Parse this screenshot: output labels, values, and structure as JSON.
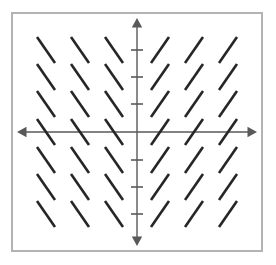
{
  "figure": {
    "kind": "slope-field",
    "title": "",
    "width": 276,
    "height": 265
  },
  "style": {
    "border_color": "#b3b3b3",
    "axis_color": "#595959",
    "segment_color": "#262626",
    "background_color": "#ffffff",
    "segment_width": 2.6,
    "axis_width": 1.4,
    "tick_width": 1.6
  },
  "frame": {
    "x": 11,
    "y": 12,
    "width": 252,
    "height": 240
  },
  "axes": {
    "origin": {
      "x": 137,
      "y": 132
    },
    "x_axis": {
      "label": "",
      "start_x": 17,
      "end_x": 257,
      "arrow_left": true,
      "arrow_right": true,
      "ticks": []
    },
    "y_axis": {
      "label": "",
      "start_y": 18,
      "end_y": 246,
      "arrow_up": true,
      "arrow_down": true,
      "tick_half_length": 6,
      "ticks": [
        50,
        77,
        104,
        160,
        187,
        214
      ]
    }
  },
  "chart_data": {
    "type": "scatter",
    "title": "",
    "xlabel": "",
    "ylabel": "",
    "xlim": [
      -3.5,
      3.5
    ],
    "ylim": [
      -3.5,
      3.5
    ],
    "grid": false,
    "legend": null,
    "columns_x": [
      46,
      80,
      114,
      160,
      194,
      228
    ],
    "rows_y": [
      50,
      77,
      104,
      132,
      160,
      187,
      214
    ],
    "segment_half_dx": 9,
    "segment_half_dy": 13,
    "slopes_by_column": [
      -1.44,
      -1.44,
      -1.44,
      1.44,
      1.44,
      1.44
    ],
    "segments": [
      {
        "cx": 46,
        "cy": 50,
        "slope": -1.44
      },
      {
        "cx": 80,
        "cy": 50,
        "slope": -1.44
      },
      {
        "cx": 114,
        "cy": 50,
        "slope": -1.44
      },
      {
        "cx": 160,
        "cy": 50,
        "slope": 1.44
      },
      {
        "cx": 194,
        "cy": 50,
        "slope": 1.44
      },
      {
        "cx": 228,
        "cy": 50,
        "slope": 1.44
      },
      {
        "cx": 46,
        "cy": 77,
        "slope": -1.44
      },
      {
        "cx": 80,
        "cy": 77,
        "slope": -1.44
      },
      {
        "cx": 114,
        "cy": 77,
        "slope": -1.44
      },
      {
        "cx": 160,
        "cy": 77,
        "slope": 1.44
      },
      {
        "cx": 194,
        "cy": 77,
        "slope": 1.44
      },
      {
        "cx": 228,
        "cy": 77,
        "slope": 1.44
      },
      {
        "cx": 46,
        "cy": 104,
        "slope": -1.44
      },
      {
        "cx": 80,
        "cy": 104,
        "slope": -1.44
      },
      {
        "cx": 114,
        "cy": 104,
        "slope": -1.44
      },
      {
        "cx": 160,
        "cy": 104,
        "slope": 1.44
      },
      {
        "cx": 194,
        "cy": 104,
        "slope": 1.44
      },
      {
        "cx": 228,
        "cy": 104,
        "slope": 1.44
      },
      {
        "cx": 46,
        "cy": 132,
        "slope": -1.44
      },
      {
        "cx": 80,
        "cy": 132,
        "slope": -1.44
      },
      {
        "cx": 114,
        "cy": 132,
        "slope": -1.44
      },
      {
        "cx": 160,
        "cy": 132,
        "slope": 1.44
      },
      {
        "cx": 194,
        "cy": 132,
        "slope": 1.44
      },
      {
        "cx": 228,
        "cy": 132,
        "slope": 1.44
      },
      {
        "cx": 46,
        "cy": 160,
        "slope": -1.44
      },
      {
        "cx": 80,
        "cy": 160,
        "slope": -1.44
      },
      {
        "cx": 114,
        "cy": 160,
        "slope": -1.44
      },
      {
        "cx": 160,
        "cy": 160,
        "slope": 1.44
      },
      {
        "cx": 194,
        "cy": 160,
        "slope": 1.44
      },
      {
        "cx": 228,
        "cy": 160,
        "slope": 1.44
      },
      {
        "cx": 46,
        "cy": 187,
        "slope": -1.44
      },
      {
        "cx": 80,
        "cy": 187,
        "slope": -1.44
      },
      {
        "cx": 114,
        "cy": 187,
        "slope": -1.44
      },
      {
        "cx": 160,
        "cy": 187,
        "slope": 1.44
      },
      {
        "cx": 194,
        "cy": 187,
        "slope": 1.44
      },
      {
        "cx": 228,
        "cy": 187,
        "slope": 1.44
      },
      {
        "cx": 46,
        "cy": 214,
        "slope": -1.44
      },
      {
        "cx": 80,
        "cy": 214,
        "slope": -1.44
      },
      {
        "cx": 114,
        "cy": 214,
        "slope": -1.44
      },
      {
        "cx": 160,
        "cy": 214,
        "slope": 1.44
      },
      {
        "cx": 194,
        "cy": 214,
        "slope": 1.44
      },
      {
        "cx": 228,
        "cy": 214,
        "slope": 1.44
      }
    ]
  }
}
